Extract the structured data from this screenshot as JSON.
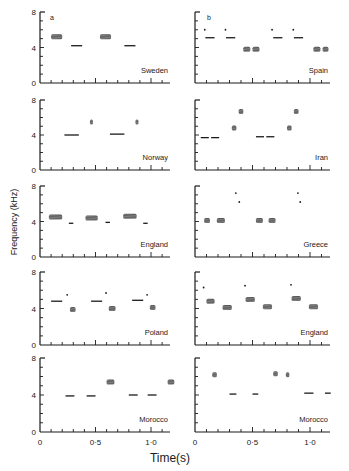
{
  "figure": {
    "xlabel": "Time(s)",
    "ylabel": "Frequency (kHz)",
    "panel_letters": [
      "a",
      "b"
    ],
    "y_ticks": [
      "0",
      "4",
      "8"
    ],
    "x_ticks": [
      "0",
      "0·5",
      "1·0"
    ]
  },
  "chart_data": {
    "type": "scatter",
    "title": "",
    "subtitle": "Sonagrams of song phrases by country (two columns, a and b)",
    "xlabel": "Time(s)",
    "ylabel": "Frequency (kHz)",
    "xlim": [
      0,
      1.2
    ],
    "ylim": [
      0,
      8
    ],
    "grid": false,
    "panels": [
      {
        "column": "a",
        "row": 1,
        "label": "Sweden",
        "elements": [
          {
            "t0": 0.1,
            "t1": 0.2,
            "f": 5.2,
            "kind": "buzz"
          },
          {
            "t0": 0.28,
            "t1": 0.38,
            "f": 4.2,
            "kind": "tone"
          },
          {
            "t0": 0.54,
            "t1": 0.64,
            "f": 5.2,
            "kind": "buzz"
          },
          {
            "t0": 0.76,
            "t1": 0.86,
            "f": 4.2,
            "kind": "tone"
          }
        ]
      },
      {
        "column": "b",
        "row": 1,
        "label": "Spain",
        "elements": [
          {
            "t0": 0.08,
            "t1": 0.09,
            "f": 6.0,
            "kind": "dot"
          },
          {
            "t0": 0.09,
            "t1": 0.17,
            "f": 5.1,
            "kind": "tone"
          },
          {
            "t0": 0.26,
            "t1": 0.27,
            "f": 6.0,
            "kind": "dot"
          },
          {
            "t0": 0.27,
            "t1": 0.35,
            "f": 5.1,
            "kind": "tone"
          },
          {
            "t0": 0.42,
            "t1": 0.48,
            "f": 3.8,
            "kind": "buzz"
          },
          {
            "t0": 0.5,
            "t1": 0.56,
            "f": 3.8,
            "kind": "buzz"
          },
          {
            "t0": 0.66,
            "t1": 0.68,
            "f": 6.0,
            "kind": "dot"
          },
          {
            "t0": 0.68,
            "t1": 0.76,
            "f": 5.1,
            "kind": "tone"
          },
          {
            "t0": 0.85,
            "t1": 0.86,
            "f": 6.0,
            "kind": "dot"
          },
          {
            "t0": 0.86,
            "t1": 0.94,
            "f": 5.1,
            "kind": "tone"
          },
          {
            "t0": 1.03,
            "t1": 1.09,
            "f": 3.8,
            "kind": "buzz"
          },
          {
            "t0": 1.11,
            "t1": 1.16,
            "f": 3.8,
            "kind": "buzz"
          }
        ]
      },
      {
        "column": "a",
        "row": 2,
        "label": "Norway",
        "elements": [
          {
            "t0": 0.22,
            "t1": 0.35,
            "f": 4.0,
            "kind": "tone"
          },
          {
            "t0": 0.45,
            "t1": 0.47,
            "f": 5.5,
            "kind": "buzz"
          },
          {
            "t0": 0.63,
            "t1": 0.76,
            "f": 4.1,
            "kind": "tone"
          },
          {
            "t0": 0.86,
            "t1": 0.88,
            "f": 5.5,
            "kind": "buzz"
          }
        ]
      },
      {
        "column": "b",
        "row": 2,
        "label": "Iran",
        "elements": [
          {
            "t0": 0.05,
            "t1": 0.12,
            "f": 3.7,
            "kind": "tone"
          },
          {
            "t0": 0.14,
            "t1": 0.21,
            "f": 3.7,
            "kind": "tone"
          },
          {
            "t0": 0.32,
            "t1": 0.36,
            "f": 4.8,
            "kind": "buzz"
          },
          {
            "t0": 0.38,
            "t1": 0.42,
            "f": 6.7,
            "kind": "buzz"
          },
          {
            "t0": 0.53,
            "t1": 0.6,
            "f": 3.8,
            "kind": "tone"
          },
          {
            "t0": 0.62,
            "t1": 0.69,
            "f": 3.8,
            "kind": "tone"
          },
          {
            "t0": 0.8,
            "t1": 0.84,
            "f": 4.8,
            "kind": "buzz"
          },
          {
            "t0": 0.86,
            "t1": 0.9,
            "f": 6.7,
            "kind": "buzz"
          }
        ]
      },
      {
        "column": "a",
        "row": 3,
        "label": "England",
        "elements": [
          {
            "t0": 0.08,
            "t1": 0.2,
            "f": 4.5,
            "kind": "buzz"
          },
          {
            "t0": 0.26,
            "t1": 0.3,
            "f": 3.8,
            "kind": "tone"
          },
          {
            "t0": 0.41,
            "t1": 0.52,
            "f": 4.4,
            "kind": "buzz"
          },
          {
            "t0": 0.59,
            "t1": 0.63,
            "f": 3.9,
            "kind": "tone"
          },
          {
            "t0": 0.75,
            "t1": 0.87,
            "f": 4.6,
            "kind": "buzz"
          },
          {
            "t0": 0.93,
            "t1": 0.97,
            "f": 3.8,
            "kind": "tone"
          }
        ]
      },
      {
        "column": "b",
        "row": 3,
        "label": "Greece",
        "elements": [
          {
            "t0": 0.08,
            "t1": 0.13,
            "f": 4.1,
            "kind": "buzz"
          },
          {
            "t0": 0.19,
            "t1": 0.26,
            "f": 4.1,
            "kind": "buzz"
          },
          {
            "t0": 0.35,
            "t1": 0.36,
            "f": 7.2,
            "kind": "dot"
          },
          {
            "t0": 0.38,
            "t1": 0.39,
            "f": 6.2,
            "kind": "dot"
          },
          {
            "t0": 0.53,
            "t1": 0.59,
            "f": 4.1,
            "kind": "buzz"
          },
          {
            "t0": 0.64,
            "t1": 0.7,
            "f": 4.1,
            "kind": "buzz"
          },
          {
            "t0": 0.89,
            "t1": 0.9,
            "f": 7.2,
            "kind": "dot"
          },
          {
            "t0": 0.91,
            "t1": 0.92,
            "f": 6.2,
            "kind": "dot"
          }
        ]
      },
      {
        "column": "a",
        "row": 4,
        "label": "Poland",
        "elements": [
          {
            "t0": 0.1,
            "t1": 0.2,
            "f": 4.8,
            "kind": "tone"
          },
          {
            "t0": 0.24,
            "t1": 0.25,
            "f": 5.5,
            "kind": "dot"
          },
          {
            "t0": 0.27,
            "t1": 0.32,
            "f": 3.9,
            "kind": "buzz"
          },
          {
            "t0": 0.46,
            "t1": 0.56,
            "f": 4.8,
            "kind": "tone"
          },
          {
            "t0": 0.59,
            "t1": 0.6,
            "f": 5.7,
            "kind": "dot"
          },
          {
            "t0": 0.62,
            "t1": 0.68,
            "f": 4.0,
            "kind": "buzz"
          },
          {
            "t0": 0.83,
            "t1": 0.93,
            "f": 4.9,
            "kind": "tone"
          },
          {
            "t0": 0.96,
            "t1": 0.97,
            "f": 5.5,
            "kind": "dot"
          },
          {
            "t0": 0.99,
            "t1": 1.04,
            "f": 4.1,
            "kind": "buzz"
          }
        ]
      },
      {
        "column": "b",
        "row": 4,
        "label": "England",
        "elements": [
          {
            "t0": 0.07,
            "t1": 0.08,
            "f": 6.3,
            "kind": "dot"
          },
          {
            "t0": 0.1,
            "t1": 0.17,
            "f": 4.8,
            "kind": "buzz"
          },
          {
            "t0": 0.24,
            "t1": 0.32,
            "f": 4.1,
            "kind": "buzz"
          },
          {
            "t0": 0.43,
            "t1": 0.44,
            "f": 6.5,
            "kind": "dot"
          },
          {
            "t0": 0.44,
            "t1": 0.52,
            "f": 5.0,
            "kind": "buzz"
          },
          {
            "t0": 0.59,
            "t1": 0.67,
            "f": 4.2,
            "kind": "buzz"
          },
          {
            "t0": 0.83,
            "t1": 0.84,
            "f": 6.6,
            "kind": "dot"
          },
          {
            "t0": 0.84,
            "t1": 0.92,
            "f": 5.1,
            "kind": "buzz"
          },
          {
            "t0": 0.99,
            "t1": 1.07,
            "f": 4.2,
            "kind": "buzz"
          }
        ]
      },
      {
        "column": "a",
        "row": 5,
        "label": "Morocco",
        "elements": [
          {
            "t0": 0.23,
            "t1": 0.31,
            "f": 3.9,
            "kind": "tone"
          },
          {
            "t0": 0.42,
            "t1": 0.5,
            "f": 3.9,
            "kind": "tone"
          },
          {
            "t0": 0.6,
            "t1": 0.67,
            "f": 5.4,
            "kind": "buzz"
          },
          {
            "t0": 0.8,
            "t1": 0.88,
            "f": 4.0,
            "kind": "tone"
          },
          {
            "t0": 0.97,
            "t1": 1.05,
            "f": 4.0,
            "kind": "tone"
          },
          {
            "t0": 1.15,
            "t1": 1.21,
            "f": 5.4,
            "kind": "buzz"
          }
        ]
      },
      {
        "column": "b",
        "row": 5,
        "label": "Morocco",
        "elements": [
          {
            "t0": 0.15,
            "t1": 0.19,
            "f": 6.2,
            "kind": "buzz"
          },
          {
            "t0": 0.3,
            "t1": 0.36,
            "f": 4.1,
            "kind": "tone"
          },
          {
            "t0": 0.5,
            "t1": 0.55,
            "f": 4.1,
            "kind": "tone"
          },
          {
            "t0": 0.68,
            "t1": 0.72,
            "f": 6.3,
            "kind": "buzz"
          },
          {
            "t0": 0.79,
            "t1": 0.82,
            "f": 6.2,
            "kind": "buzz"
          },
          {
            "t0": 0.95,
            "t1": 1.03,
            "f": 4.2,
            "kind": "tone"
          },
          {
            "t0": 1.13,
            "t1": 1.18,
            "f": 4.2,
            "kind": "tone"
          }
        ]
      }
    ]
  }
}
